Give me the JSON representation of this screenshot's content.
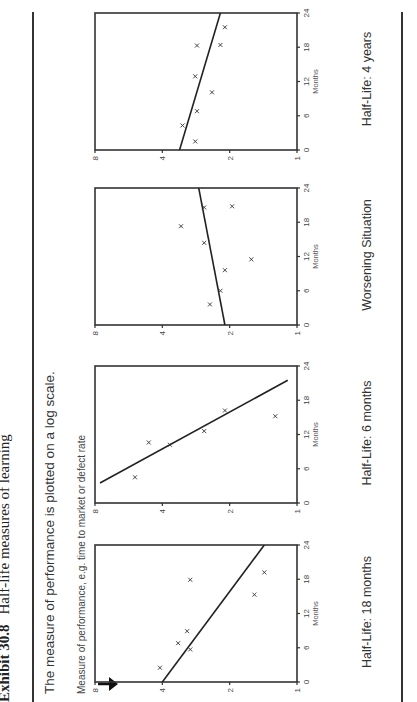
{
  "title": {
    "exhibit": "Exhibit 30.8",
    "text": "Half-life measures of learning"
  },
  "subtitle": "The measure of performance is plotted on a log scale.",
  "y_axis_note": "Measure of performance, e.g. time to market or defect rate",
  "panels": [
    {
      "caption": "Half-Life:  18 months",
      "x_label": "Months"
    },
    {
      "caption": "Half-Life:  6 months",
      "x_label": "Months"
    },
    {
      "caption": "Worsening Situation",
      "x_label": "Months"
    },
    {
      "caption": "Half-Life:  4 years",
      "x_label": "Months"
    }
  ],
  "axis_ticks": {
    "x": [
      "0",
      "6",
      "12",
      "18",
      "24"
    ],
    "y": [
      "8",
      "4",
      "2",
      "1"
    ]
  },
  "chart_data": [
    {
      "type": "scatter",
      "title": "Half-Life: 18 months",
      "xlabel": "Months",
      "ylabel": "Measure of performance (log scale)",
      "xlim": [
        0,
        24
      ],
      "ylim": [
        1,
        8
      ],
      "yscale": "log2",
      "x_ticks": [
        0,
        6,
        12,
        18,
        24
      ],
      "y_ticks": [
        1,
        2,
        4,
        8
      ],
      "points": [
        {
          "x": 2.5,
          "y": 4.1
        },
        {
          "x": 6.8,
          "y": 3.4
        },
        {
          "x": 5.7,
          "y": 3.0
        },
        {
          "x": 8.9,
          "y": 3.1
        },
        {
          "x": 17.9,
          "y": 3.0
        },
        {
          "x": 15.3,
          "y": 1.55
        },
        {
          "x": 19.2,
          "y": 1.4
        }
      ],
      "trend_line": [
        {
          "x": 0,
          "y": 4.0
        },
        {
          "x": 24,
          "y": 1.4
        }
      ]
    },
    {
      "type": "scatter",
      "title": "Half-Life: 6 months",
      "xlabel": "Months",
      "ylabel": "Measure of performance (log scale)",
      "xlim": [
        0,
        24
      ],
      "ylim": [
        1,
        8
      ],
      "yscale": "log2",
      "x_ticks": [
        0,
        6,
        12,
        18,
        24
      ],
      "y_ticks": [
        1,
        2,
        4,
        8
      ],
      "points": [
        {
          "x": 4.5,
          "y": 5.3
        },
        {
          "x": 10.6,
          "y": 4.6
        },
        {
          "x": 10.2,
          "y": 3.7
        },
        {
          "x": 12.6,
          "y": 2.6
        },
        {
          "x": 16.2,
          "y": 2.1
        },
        {
          "x": 15.2,
          "y": 1.25
        }
      ],
      "trend_line": [
        {
          "x": 3.5,
          "y": 7.6
        },
        {
          "x": 21.5,
          "y": 1.1
        }
      ]
    },
    {
      "type": "scatter",
      "title": "Worsening Situation",
      "xlabel": "Months",
      "ylabel": "Measure of performance (log scale)",
      "xlim": [
        0,
        24
      ],
      "ylim": [
        1,
        8
      ],
      "yscale": "log2",
      "x_ticks": [
        0,
        6,
        12,
        18,
        24
      ],
      "y_ticks": [
        1,
        2,
        4,
        8
      ],
      "points": [
        {
          "x": 3.6,
          "y": 2.45
        },
        {
          "x": 6.0,
          "y": 2.2
        },
        {
          "x": 9.6,
          "y": 2.1
        },
        {
          "x": 11.5,
          "y": 1.6
        },
        {
          "x": 14.4,
          "y": 2.6
        },
        {
          "x": 17.3,
          "y": 3.3
        },
        {
          "x": 20.6,
          "y": 2.6
        },
        {
          "x": 20.8,
          "y": 1.95
        }
      ],
      "trend_line": [
        {
          "x": 0,
          "y": 2.1
        },
        {
          "x": 24,
          "y": 2.75
        }
      ]
    },
    {
      "type": "scatter",
      "title": "Half-Life: 4 years",
      "xlabel": "Months",
      "ylabel": "Measure of performance (log scale)",
      "xlim": [
        0,
        24
      ],
      "ylim": [
        1,
        8
      ],
      "yscale": "log2",
      "x_ticks": [
        0,
        6,
        12,
        18,
        24
      ],
      "y_ticks": [
        1,
        2,
        4,
        8
      ],
      "points": [
        {
          "x": 1.5,
          "y": 2.85
        },
        {
          "x": 4.3,
          "y": 3.25
        },
        {
          "x": 6.8,
          "y": 2.8
        },
        {
          "x": 10.1,
          "y": 2.4
        },
        {
          "x": 12.9,
          "y": 2.85
        },
        {
          "x": 18.4,
          "y": 2.2
        },
        {
          "x": 18.3,
          "y": 2.8
        },
        {
          "x": 21.5,
          "y": 2.1
        }
      ],
      "trend_line": [
        {
          "x": 0,
          "y": 3.35
        },
        {
          "x": 24,
          "y": 2.2
        }
      ]
    }
  ]
}
